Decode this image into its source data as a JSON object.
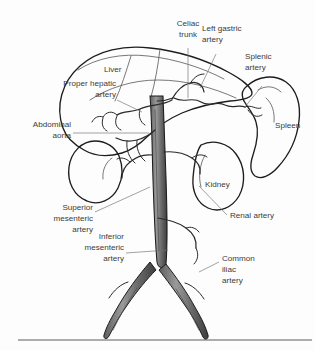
{
  "figure": {
    "background_color": "#fdfdfd",
    "ink_color": "#1d1d1d",
    "label_color": "#3b3b3b",
    "leader_color": "#6f6f6f",
    "width": 315,
    "height": 351
  },
  "labels": {
    "celiac_trunk": {
      "line1": "Celiac",
      "line2": "trunk"
    },
    "left_gastric_artery": {
      "line1": "Left gastric",
      "line2": "artery"
    },
    "splenic_artery": {
      "line1": "Splenic",
      "line2": "artery"
    },
    "liver": {
      "line1": "Liver"
    },
    "proper_hepatic_artery": {
      "line1": "Proper hepatic",
      "line2": "artery"
    },
    "abdominal_aorta": {
      "line1": "Abdominal",
      "line2": "aorta"
    },
    "spleen": {
      "line1": "Spleen"
    },
    "kidney": {
      "line1": "Kidney"
    },
    "renal_artery": {
      "line1": "Renal artery"
    },
    "superior_mesenteric_artery": {
      "line1": "Superior",
      "line2": "mesenteric",
      "line3": "artery"
    },
    "inferior_mesenteric_artery": {
      "line1": "Inferior",
      "line2": "mesenteric",
      "line3": "artery"
    },
    "common_iliac_artery": {
      "line1": "Common",
      "line2": "iliac",
      "line3": "artery"
    }
  },
  "structures": {
    "liver": "liver",
    "spleen": "spleen",
    "left_kidney": "left-kidney",
    "right_kidney": "right-kidney",
    "aorta": "abdominal-aorta",
    "celiac_trunk": "celiac-trunk",
    "left_gastric_artery": "left-gastric-artery",
    "splenic_artery": "splenic-artery",
    "common_hepatic_artery": "common-hepatic-artery",
    "proper_hepatic_artery": "proper-hepatic-artery",
    "superior_mesenteric_artery": "superior-mesenteric-artery",
    "inferior_mesenteric_artery": "inferior-mesenteric-artery",
    "renal_arteries": "renal-arteries",
    "common_iliac_arteries": "common-iliac-arteries"
  }
}
